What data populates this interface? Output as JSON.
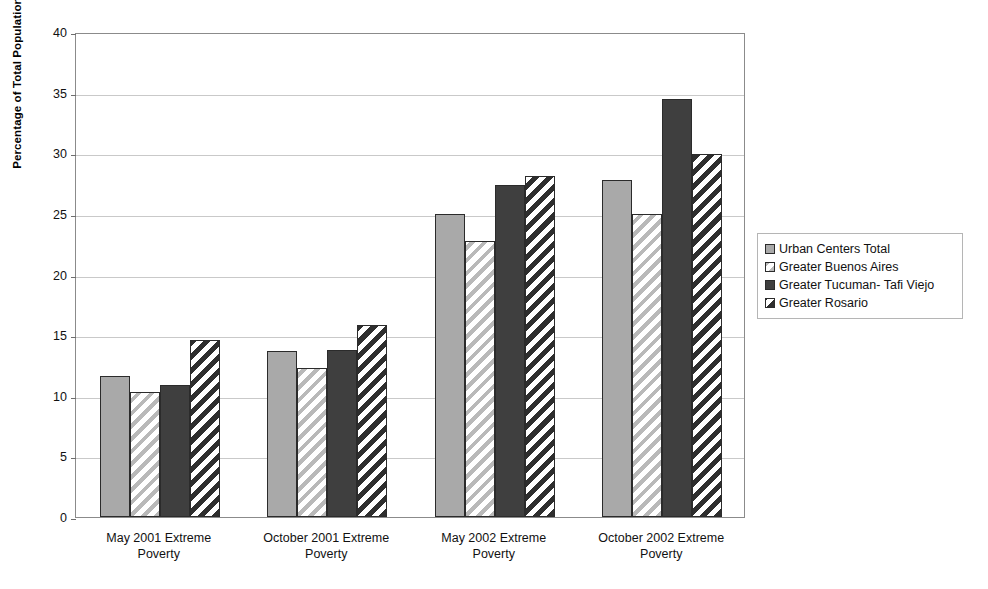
{
  "chart_data": {
    "type": "bar",
    "title": "",
    "subtitle": "",
    "xlabel": "",
    "ylabel": "Percentage of Total Population",
    "ylim": [
      0,
      40
    ],
    "ytick_values": [
      0,
      5,
      10,
      15,
      20,
      25,
      30,
      35,
      40
    ],
    "ytick_labels": [
      "0",
      "5",
      "10",
      "15",
      "20",
      "25",
      "30",
      "35",
      "40"
    ],
    "grid": true,
    "legend_position": "right",
    "categories": [
      "May 2001 Extreme Poverty",
      "October 2001 Extreme Poverty",
      "May 2002 Extreme Poverty",
      "October 2002 Extreme Poverty"
    ],
    "category_lines": [
      [
        "May 2001 Extreme",
        "Poverty"
      ],
      [
        "October 2001 Extreme",
        "Poverty"
      ],
      [
        "May 2002 Extreme",
        "Poverty"
      ],
      [
        "October 2002 Extreme",
        "Poverty"
      ]
    ],
    "series": [
      {
        "name": "Urban Centers Total",
        "pattern": "solid-light",
        "color": "#a9a9a9",
        "values": [
          11.6,
          13.7,
          25.0,
          27.8
        ]
      },
      {
        "name": "Greater Buenos Aires",
        "pattern": "hatch-light",
        "color": "#b9b9b9",
        "values": [
          10.3,
          12.3,
          22.8,
          25.0
        ]
      },
      {
        "name": "Greater Tucuman- Tafi Viejo",
        "pattern": "solid-dark",
        "color": "#3f3f3f",
        "values": [
          10.9,
          13.8,
          27.4,
          34.5
        ]
      },
      {
        "name": "Greater Rosario",
        "pattern": "hatch-dark",
        "color": "#2e2e2e",
        "values": [
          14.6,
          15.8,
          28.1,
          29.9
        ]
      }
    ]
  },
  "legend": {
    "entries": [
      "Urban Centers Total",
      "Greater Buenos Aires",
      "Greater Tucuman- Tafi Viejo",
      "Greater Rosario"
    ]
  }
}
